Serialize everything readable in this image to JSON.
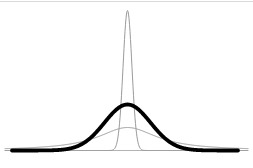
{
  "figure": {
    "width": 253,
    "height": 168,
    "background_color": "#ffffff",
    "top_border": {
      "y": 1.5,
      "x_start": 0,
      "x_end": 253,
      "color": "#d9d9d9",
      "stroke_width": 1
    },
    "axis": {
      "y": 150.5,
      "x_start": 5,
      "x_end": 248,
      "color": "#b3b3b3",
      "stroke_width": 1
    }
  },
  "chart_data": {
    "type": "line",
    "title": "",
    "xlabel": "",
    "ylabel": "",
    "tick_labels": "none",
    "legend": "none",
    "grid": false,
    "center_x": 127.5,
    "baseline_y": 150.5,
    "series": [
      {
        "name": "wide-flat-curve",
        "model": "cauchy",
        "center": 127.5,
        "peak_height": 23,
        "gamma": 36,
        "x_start": 5,
        "x_end": 248,
        "color": "#9a9a9a",
        "stroke_width": 1
      },
      {
        "name": "narrow-peaked-curve",
        "model": "gaussian",
        "center": 127.5,
        "peak_height": 140,
        "sigma": 4.4,
        "x_start": 5,
        "x_end": 248,
        "color": "#9a9a9a",
        "stroke_width": 1
      },
      {
        "name": "bold-normal-curve",
        "model": "gaussian",
        "center": 127.5,
        "peak_height": 46,
        "sigma": 23,
        "x_start": 12,
        "x_end": 238,
        "color": "#000000",
        "stroke_width": 3.8
      }
    ]
  }
}
